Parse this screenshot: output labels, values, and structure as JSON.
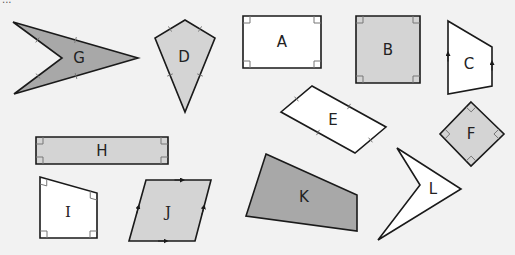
{
  "diagram": {
    "type": "quadrilateral-classification-worksheet",
    "partial_header_text": "...",
    "colors": {
      "background": "#f2f2f2",
      "dark_fill": "#a8a8a8",
      "light_fill": "#d4d4d4",
      "white_fill": "#ffffff",
      "stroke": "#1a1a1a"
    },
    "shapes": [
      {
        "id": "G",
        "label": "G",
        "kind": "arrowhead (dart)",
        "fill": "#a8a8a8",
        "points": [
          [
            13,
            22
          ],
          [
            138,
            58
          ],
          [
            14,
            94
          ],
          [
            62,
            58
          ]
        ],
        "label_pos": [
          79,
          58
        ],
        "marks": "equal-side ticks"
      },
      {
        "id": "D",
        "label": "D",
        "kind": "kite",
        "fill": "#d4d4d4",
        "points": [
          [
            185,
            20
          ],
          [
            215,
            38
          ],
          [
            185,
            112
          ],
          [
            155,
            38
          ]
        ],
        "label_pos": [
          184,
          57
        ],
        "marks": "equal-side ticks"
      },
      {
        "id": "A",
        "label": "A",
        "kind": "rectangle",
        "fill": "#ffffff",
        "points": [
          [
            243,
            16
          ],
          [
            321,
            16
          ],
          [
            321,
            68
          ],
          [
            243,
            68
          ]
        ],
        "label_pos": [
          282,
          42
        ],
        "marks": "right angles"
      },
      {
        "id": "B",
        "label": "B",
        "kind": "square",
        "fill": "#d4d4d4",
        "points": [
          [
            356,
            16
          ],
          [
            420,
            16
          ],
          [
            420,
            83
          ],
          [
            356,
            83
          ]
        ],
        "label_pos": [
          388,
          50
        ],
        "marks": "right angles"
      },
      {
        "id": "C",
        "label": "C",
        "kind": "trapezium",
        "fill": "#ffffff",
        "points": [
          [
            448,
            21
          ],
          [
            492,
            47
          ],
          [
            492,
            86
          ],
          [
            448,
            94
          ]
        ],
        "label_pos": [
          469,
          64
        ],
        "marks": "parallel arrows"
      },
      {
        "id": "E",
        "label": "E",
        "kind": "parallelogram (rectangle rotated)",
        "fill": "#ffffff",
        "points": [
          [
            312,
            86
          ],
          [
            386,
            127
          ],
          [
            355,
            153
          ],
          [
            281,
            112
          ]
        ],
        "label_pos": [
          333,
          120
        ],
        "marks": "equal-side ticks"
      },
      {
        "id": "F",
        "label": "F",
        "kind": "square (rotated)",
        "fill": "#d4d4d4",
        "points": [
          [
            471,
            102
          ],
          [
            504,
            134
          ],
          [
            471,
            166
          ],
          [
            440,
            134
          ]
        ],
        "label_pos": [
          471,
          134
        ],
        "marks": "right angles"
      },
      {
        "id": "H",
        "label": "H",
        "kind": "rectangle",
        "fill": "#d4d4d4",
        "points": [
          [
            36,
            137
          ],
          [
            168,
            137
          ],
          [
            168,
            164
          ],
          [
            36,
            164
          ]
        ],
        "label_pos": [
          102,
          151
        ],
        "marks": "right angles"
      },
      {
        "id": "I",
        "label": "I",
        "kind": "right trapezium",
        "fill": "#ffffff",
        "points": [
          [
            40,
            177
          ],
          [
            97,
            193
          ],
          [
            97,
            238
          ],
          [
            40,
            238
          ]
        ],
        "label_pos": [
          68,
          212
        ],
        "marks": "right angles",
        "serif": true
      },
      {
        "id": "J",
        "label": "J",
        "kind": "parallelogram",
        "fill": "#d4d4d4",
        "points": [
          [
            146,
            180
          ],
          [
            211,
            180
          ],
          [
            195,
            241
          ],
          [
            129,
            241
          ]
        ],
        "label_pos": [
          168,
          212
        ],
        "marks": "parallel arrows",
        "serif": true
      },
      {
        "id": "K",
        "label": "K",
        "kind": "irregular quadrilateral",
        "fill": "#a8a8a8",
        "points": [
          [
            266,
            154
          ],
          [
            357,
            195
          ],
          [
            357,
            231
          ],
          [
            246,
            216
          ]
        ],
        "label_pos": [
          304,
          197
        ],
        "marks": "none"
      },
      {
        "id": "L",
        "label": "L",
        "kind": "arrowhead (dart)",
        "fill": "#ffffff",
        "points": [
          [
            397,
            148
          ],
          [
            461,
            189
          ],
          [
            378,
            240
          ],
          [
            420,
            185
          ]
        ],
        "label_pos": [
          433,
          189
        ],
        "marks": "none"
      }
    ]
  }
}
